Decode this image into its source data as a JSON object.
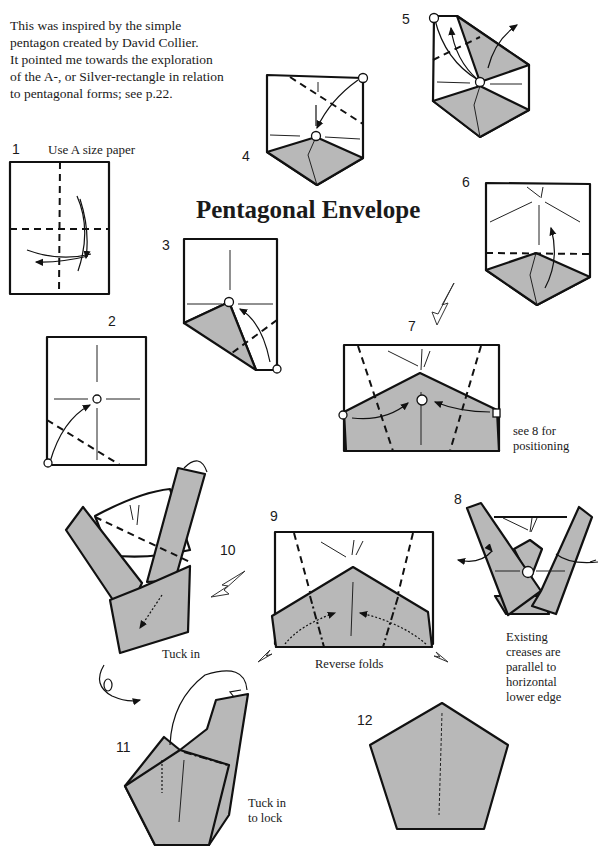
{
  "intro": {
    "lines": [
      "This was inspired by the simple",
      "pentagon created by David Collier.",
      "It pointed me towards the exploration",
      "of the A-, or Silver-rectangle in relation",
      "to pentagonal forms; see p.22."
    ]
  },
  "title": "Pentagonal Envelope",
  "steps": [
    {
      "number": "1",
      "caption": "Use A size paper"
    },
    {
      "number": "2",
      "caption": ""
    },
    {
      "number": "3",
      "caption": ""
    },
    {
      "number": "4",
      "caption": ""
    },
    {
      "number": "5",
      "caption": ""
    },
    {
      "number": "6",
      "caption": ""
    },
    {
      "number": "7",
      "caption": "see 8 for positioning",
      "caption_lines": [
        "see 8 for",
        "positioning"
      ]
    },
    {
      "number": "8",
      "caption": "Existing creases are parallel to horizontal lower edge",
      "caption_lines": [
        "Existing",
        "creases are",
        "parallel to",
        "horizontal",
        "lower edge"
      ]
    },
    {
      "number": "9",
      "caption": "Reverse folds"
    },
    {
      "number": "10",
      "caption": "Tuck in"
    },
    {
      "number": "11",
      "caption": "Tuck in to lock",
      "caption_lines": [
        "Tuck in",
        "to lock"
      ]
    },
    {
      "number": "12",
      "caption": ""
    }
  ],
  "colors": {
    "paper_shade": "#b8b8b8",
    "ink": "#111111"
  }
}
